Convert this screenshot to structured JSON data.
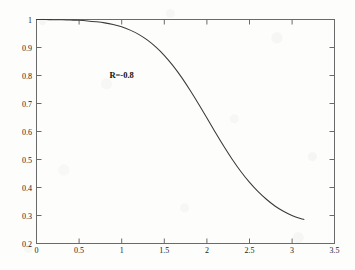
{
  "figure": {
    "background_color": "#fdfdfb",
    "axis_color": "#5a5a5a",
    "curve_color": "#3a3a3a",
    "text_color": "#1b1b1b"
  },
  "chart_data": {
    "type": "line",
    "title": "",
    "xlabel": "",
    "ylabel": "",
    "xlim": [
      0,
      3.5
    ],
    "ylim": [
      0.2,
      1.0
    ],
    "grid": false,
    "legend": null,
    "x_ticks": [
      "0",
      "0.5",
      "1",
      "1.5",
      "2",
      "2.5",
      "3",
      "3.5"
    ],
    "x_tick_values": [
      0,
      0.5,
      1,
      1.5,
      2,
      2.5,
      3,
      3.5
    ],
    "y_ticks": [
      "0.2",
      "0.3",
      "0.4",
      "0.5",
      "0.6",
      "0.7",
      "0.8",
      "0.9",
      "1"
    ],
    "y_tick_values": [
      0.2,
      0.3,
      0.4,
      0.5,
      0.6,
      0.7,
      0.8,
      0.9,
      1.0
    ],
    "annotations": [
      {
        "text": "R=-0.8",
        "x": 1.0,
        "y": 0.79
      }
    ],
    "series": [
      {
        "name": "curve",
        "x": [
          0.0,
          0.1,
          0.2,
          0.3,
          0.4,
          0.5,
          0.6,
          0.7,
          0.8,
          0.9,
          1.0,
          1.1,
          1.2,
          1.3,
          1.4,
          1.5,
          1.6,
          1.7,
          1.8,
          1.9,
          2.0,
          2.1,
          2.2,
          2.3,
          2.4,
          2.5,
          2.6,
          2.7,
          2.8,
          2.9,
          3.0,
          3.1,
          3.1416
        ],
        "values": [
          1.0,
          1.0,
          0.999,
          0.999,
          0.998,
          0.997,
          0.995,
          0.992,
          0.988,
          0.982,
          0.974,
          0.962,
          0.947,
          0.927,
          0.902,
          0.872,
          0.836,
          0.795,
          0.749,
          0.7,
          0.649,
          0.597,
          0.547,
          0.5,
          0.457,
          0.419,
          0.386,
          0.358,
          0.334,
          0.315,
          0.3,
          0.289,
          0.286
        ]
      }
    ]
  }
}
